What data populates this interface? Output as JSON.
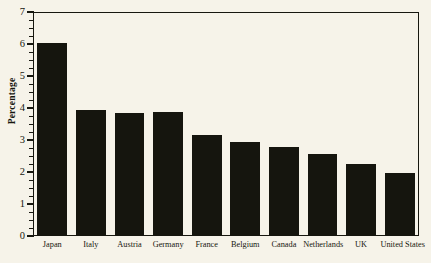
{
  "chart_data": {
    "type": "bar",
    "title": "",
    "subtitle": "",
    "xlabel": "",
    "ylabel": "Percentage",
    "categories": [
      "Japan",
      "Italy",
      "Austria",
      "Germany",
      "France",
      "Belgium",
      "Canada",
      "Netherlands",
      "UK",
      "United States"
    ],
    "values": [
      6.03,
      3.95,
      3.85,
      3.86,
      3.15,
      2.95,
      2.77,
      2.56,
      2.26,
      1.98
    ],
    "ylim": [
      0,
      7
    ],
    "xlim_note": "categorical",
    "ytick_labels": [
      "0",
      "1",
      "2",
      "3",
      "4",
      "5",
      "6",
      "7"
    ],
    "ytick_values": [
      0,
      1,
      2,
      3,
      4,
      5,
      6,
      7
    ],
    "yminor_interval": 0.25,
    "grid": false,
    "legend": false,
    "legend_position": "none",
    "bar_color": "#15150e",
    "background_color": "#f6f3e9",
    "axis_color": "#17170f",
    "orientation": "vertical"
  },
  "figure": {
    "width": 431,
    "height": 263
  }
}
